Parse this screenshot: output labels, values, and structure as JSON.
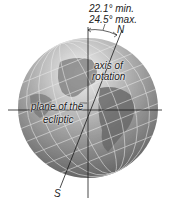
{
  "diagram": {
    "tilt_range": {
      "min_label": "22.1° min.",
      "max_label": "24.5° max."
    },
    "labels": {
      "north": "N",
      "south": "S",
      "axis": [
        "axis of",
        "rotation"
      ],
      "ecliptic": [
        "plane of the",
        "ecliptic"
      ]
    },
    "colors": {
      "globe_light": "#d8d8d8",
      "globe_dark": "#5a5a5a",
      "land": "#6e6e6e",
      "grid": "#e8e8e8",
      "lines": "#1a1a1a"
    }
  }
}
